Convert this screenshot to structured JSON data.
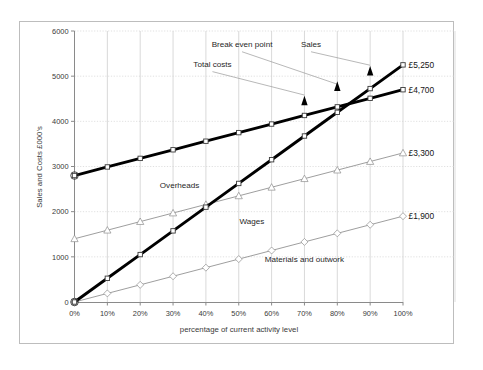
{
  "chart_data": {
    "type": "line",
    "title": "",
    "xlabel": "percentage of current activity level",
    "ylabel": "Sales and Costs  £000's",
    "categories": [
      "0%",
      "10%",
      "20%",
      "30%",
      "40%",
      "50%",
      "60%",
      "70%",
      "80%",
      "90%",
      "100%"
    ],
    "x_numeric": [
      0,
      10,
      20,
      30,
      40,
      50,
      60,
      70,
      80,
      90,
      100
    ],
    "xlim": [
      0,
      100
    ],
    "ylim": [
      0,
      6000
    ],
    "y_ticks": [
      0,
      1000,
      2000,
      3000,
      4000,
      5000,
      6000
    ],
    "y_tick_labels": [
      "0",
      "1000",
      "2000",
      "3000",
      "4000",
      "5000",
      "6000"
    ],
    "grid": true,
    "legend_position": "none (in-plot text labels)",
    "series": [
      {
        "name": "Sales",
        "marker": "square",
        "line_style": "thick-solid-black",
        "end_label": "£5,250",
        "values": [
          0,
          525,
          1050,
          1575,
          2100,
          2625,
          3150,
          3675,
          4200,
          4725,
          5250
        ]
      },
      {
        "name": "Total costs",
        "marker": "square",
        "line_style": "thick-solid-black",
        "end_label": "£4,700",
        "values": [
          2800,
          2990,
          3180,
          3370,
          3560,
          3750,
          3940,
          4130,
          4320,
          4510,
          4700
        ]
      },
      {
        "name": "Overheads",
        "marker": "triangle",
        "line_style": "thin-solid-gray",
        "end_label": "£3,300",
        "values": [
          1400,
          1590,
          1780,
          1970,
          2160,
          2350,
          2540,
          2730,
          2920,
          3110,
          3300
        ]
      },
      {
        "name": "Materials and outwork",
        "marker": "diamond",
        "line_style": "thin-solid-gray",
        "end_label": "£1,900",
        "values": [
          0,
          190,
          380,
          570,
          760,
          950,
          1140,
          1330,
          1520,
          1710,
          1900
        ]
      }
    ],
    "annotations": [
      {
        "id": "break-even-point",
        "text": "Break even point",
        "text_x_pct": 51,
        "text_y_val": 5640,
        "arrow_tip_x_pct": 80,
        "arrow_tip_y_val": 4700
      },
      {
        "id": "sales-callout",
        "text": "Sales",
        "text_x_pct": 72,
        "text_y_val": 5640,
        "arrow_tip_x_pct": 90,
        "arrow_tip_y_val": 5120
      },
      {
        "id": "total-costs-callout",
        "text": "Total costs",
        "text_x_pct": 42,
        "text_y_val": 5200,
        "arrow_tip_x_pct": 70,
        "arrow_tip_y_val": 4460
      },
      {
        "id": "overheads-label",
        "text": "Overheads",
        "text_x_pct": 32,
        "text_y_val": 2520
      },
      {
        "id": "wages-label",
        "text": "Wages",
        "text_x_pct": 54,
        "text_y_val": 1720
      },
      {
        "id": "materials-label",
        "text": "Materials and outwork",
        "text_x_pct": 70,
        "text_y_val": 880
      }
    ],
    "arrowheads": [
      {
        "x_pct": 70,
        "y_val": 4460
      },
      {
        "x_pct": 80,
        "y_val": 4780
      },
      {
        "x_pct": 90,
        "y_val": 5120
      }
    ]
  },
  "colors": {
    "background": "#ffffff",
    "frame_border": "#b9b9b9",
    "axis_line": "#8a8a8a",
    "grid_line": "#d6d6d6",
    "series_bold": "#000000",
    "series_thin": "#8c8c8c",
    "text": "#2b2b2b"
  }
}
